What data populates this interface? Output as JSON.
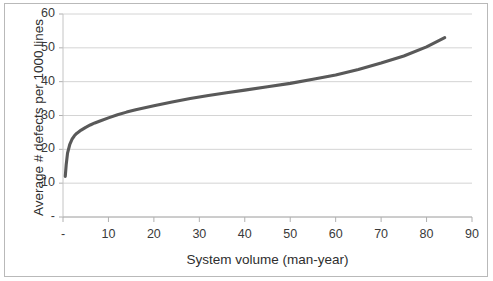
{
  "chart_data": {
    "type": "line",
    "title": "",
    "xlabel": "System volume (man-year)",
    "ylabel": "Average # defects per 1000 lines",
    "xlim": [
      0,
      90
    ],
    "ylim": [
      0,
      60
    ],
    "xticks": [
      "-",
      "10",
      "20",
      "30",
      "40",
      "50",
      "60",
      "70",
      "80",
      "90"
    ],
    "xtick_values": [
      0,
      10,
      20,
      30,
      40,
      50,
      60,
      70,
      80,
      90
    ],
    "yticks": [
      "-",
      "10",
      "20",
      "30",
      "40",
      "50",
      "60"
    ],
    "ytick_values": [
      0,
      10,
      20,
      30,
      40,
      50,
      60
    ],
    "grid": "horizontal",
    "legend": "none",
    "line_color": "#595959",
    "grid_color": "#d4d4d4",
    "axis_color": "#bfbfbf",
    "series": [
      {
        "name": "Average # defects per 1000 lines",
        "x": [
          0.5,
          0.7,
          1,
          1.5,
          2,
          2.5,
          3,
          4,
          5,
          6,
          7,
          8,
          10,
          12,
          14,
          16,
          18,
          20,
          24,
          28,
          32,
          36,
          40,
          45,
          50,
          55,
          60,
          65,
          70,
          75,
          80,
          84
        ],
        "values": [
          12.0,
          15.4,
          18.9,
          21.5,
          23.0,
          24.0,
          24.7,
          25.7,
          26.5,
          27.2,
          27.8,
          28.3,
          29.3,
          30.2,
          31.0,
          31.7,
          32.3,
          32.9,
          34.0,
          35.0,
          35.9,
          36.7,
          37.5,
          38.5,
          39.5,
          40.7,
          42.0,
          43.6,
          45.5,
          47.6,
          50.3,
          53.0
        ]
      }
    ]
  }
}
